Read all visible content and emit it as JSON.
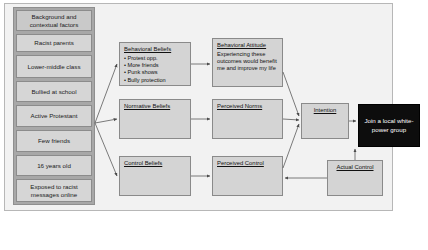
{
  "diagram": {
    "background_panel": {
      "header": "Background and contextual factors",
      "items": [
        "Racist parents",
        "Lower-middle class",
        "Bullied at school",
        "Active Protestant",
        "Few friends",
        "16 years old",
        "Exposed to racist messages online"
      ]
    },
    "nodes": {
      "behavioral_beliefs": {
        "title": "Behavioral Beliefs",
        "bullets": [
          "Protest opp.",
          "More friends",
          "Punk shows",
          "Bully protection"
        ]
      },
      "behavioral_attitude": {
        "title": "Behavioral Attitude",
        "body": "Experiencing these outcomes would benefit me and improve my life"
      },
      "normative_beliefs": {
        "title": "Normative Beliefs"
      },
      "perceived_norms": {
        "title": "Perceived Norms"
      },
      "control_beliefs": {
        "title": "Control Beliefs"
      },
      "perceived_control": {
        "title": "Perceived Control"
      },
      "intention": {
        "title": "Intention"
      },
      "actual_control": {
        "title": "Actual Control"
      },
      "behavior": {
        "title": "Join a local white-power group"
      }
    },
    "colors": {
      "page": "#ffffff",
      "frame": "#f2f2f2",
      "panel": "#a8a8a8",
      "box": "#d4d4d4",
      "context_box": "#d6d6d6",
      "goal_box": "#0d0d0d",
      "goal_text": "#ffffff",
      "stroke": "#555555"
    }
  }
}
